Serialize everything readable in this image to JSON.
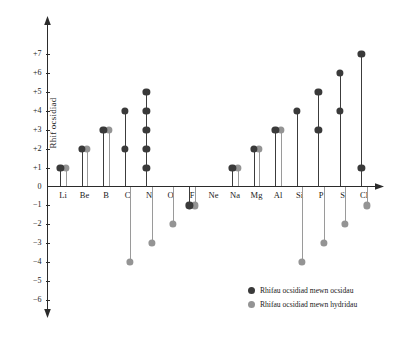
{
  "chart_data": {
    "type": "scatter",
    "title": "",
    "xlabel": "",
    "ylabel": "Rhif ocsidiad",
    "ylim": [
      -6,
      7
    ],
    "grid": false,
    "legend_position": "bottom-right",
    "yticks": [
      "+7",
      "+6",
      "+5",
      "+4",
      "+3",
      "+2",
      "+1",
      "0",
      "−1",
      "−2",
      "−3",
      "−4",
      "−5",
      "−6"
    ],
    "ytick_values": [
      7,
      6,
      5,
      4,
      3,
      2,
      1,
      0,
      -1,
      -2,
      -3,
      -4,
      -5,
      -6
    ],
    "categories": [
      "Li",
      "Be",
      "B",
      "C",
      "N",
      "O",
      "F",
      "Ne",
      "Na",
      "Mg",
      "Al",
      "Si",
      "P",
      "S",
      "Cl"
    ],
    "series": [
      {
        "name": "Rhifau ocsidiad mewn ocsidau",
        "color": "#3a3a3a",
        "values_by_category": {
          "Li": [
            1
          ],
          "Be": [
            2
          ],
          "B": [
            3
          ],
          "C": [
            2,
            4
          ],
          "N": [
            1,
            2,
            3,
            4,
            5
          ],
          "O": [],
          "F": [
            -1
          ],
          "Ne": [],
          "Na": [
            1
          ],
          "Mg": [
            2
          ],
          "Al": [
            3
          ],
          "Si": [
            4
          ],
          "P": [
            3,
            5
          ],
          "S": [
            4,
            6
          ],
          "Cl": [
            1,
            7
          ]
        }
      },
      {
        "name": "Rhifau ocsidiad mewn hydridau",
        "color": "#949494",
        "values_by_category": {
          "Li": [
            1
          ],
          "Be": [
            2
          ],
          "B": [
            3
          ],
          "C": [
            -4
          ],
          "N": [
            -3
          ],
          "O": [
            -2
          ],
          "F": [
            -1
          ],
          "Ne": [],
          "Na": [
            1
          ],
          "Mg": [
            2
          ],
          "Al": [
            3
          ],
          "Si": [
            -4
          ],
          "P": [
            -3
          ],
          "S": [
            -2
          ],
          "Cl": [
            -1
          ]
        }
      }
    ]
  },
  "legend": {
    "items": [
      {
        "label": "Rhifau ocsidiad mewn ocsidau",
        "swatch": "dark-dot-icon"
      },
      {
        "label": "Rhifau ocsidiad mewn hydridau",
        "swatch": "light-dot-icon"
      }
    ]
  },
  "axis": {
    "y_title": "Rhif ocsidiad"
  }
}
